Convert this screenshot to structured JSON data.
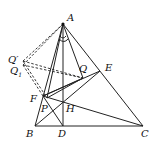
{
  "points": {
    "A": {
      "label": "A",
      "x": 63,
      "y": 24
    },
    "B": {
      "label": "B",
      "x": 35,
      "y": 126
    },
    "C": {
      "label": "C",
      "x": 143,
      "y": 126
    },
    "D": {
      "label": "D",
      "x": 63,
      "y": 126
    },
    "E": {
      "label": "E",
      "x": 100,
      "y": 71
    },
    "F": {
      "label": "F",
      "x": 43,
      "y": 96
    },
    "H": {
      "label": "H",
      "x": 63,
      "y": 101
    },
    "P": {
      "label": "P",
      "x": 47,
      "y": 98
    },
    "Q": {
      "label": "Q",
      "x": 83,
      "y": 78
    },
    "Q1": {
      "label": "Q",
      "sub": "1",
      "x": 23,
      "y": 65
    },
    "Qp": {
      "label": "Q′",
      "x": 23,
      "y": 61
    }
  },
  "colors": {
    "stroke": "#222222",
    "background": "#ffffff"
  }
}
